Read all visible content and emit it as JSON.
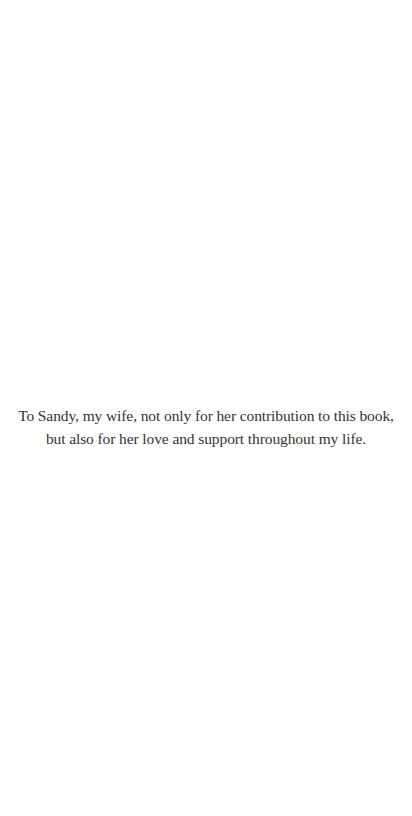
{
  "page": {
    "type": "dedication",
    "background_color": "#ffffff",
    "text_color": "#333333"
  },
  "dedication": {
    "lines": [
      "To Sandy, my wife, not only for her contribution to this book,",
      "but also for her love and support throughout my life."
    ]
  }
}
